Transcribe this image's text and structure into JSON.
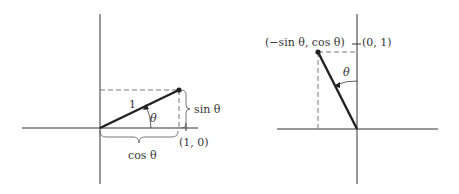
{
  "left_diagram": {
    "description": "Unit vector (1,0) rotated by theta",
    "labels": {
      "hypotenuse": "1",
      "angle": "θ",
      "sin": "sin θ",
      "cos": "cos θ",
      "tick": "(1, 0)"
    },
    "geometry": {
      "origin": [
        100,
        128
      ],
      "point": [
        179,
        90
      ],
      "tick_x": 186,
      "x_axis": [
        22,
        198
      ],
      "y_axis": [
        14,
        184
      ]
    }
  },
  "right_diagram": {
    "description": "Unit vector (0,1) rotated by theta",
    "labels": {
      "point": "(−sin θ, cos θ)",
      "angle": "θ",
      "tick": "(0, 1)"
    },
    "geometry": {
      "origin": [
        357,
        129
      ],
      "point": [
        318,
        52
      ],
      "tick_y": 44,
      "x_axis": [
        277,
        438
      ],
      "y_axis": [
        14,
        184
      ]
    }
  },
  "colors": {
    "line": "#2a2a2a",
    "dash": "#777777",
    "text": "#333333"
  }
}
